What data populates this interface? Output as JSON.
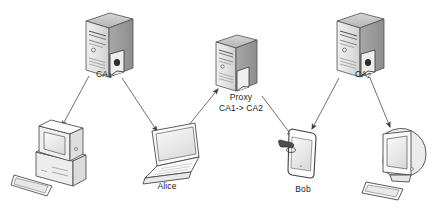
{
  "diagram": {
    "background_color": "#ffffff",
    "stroke_color": "#4a4a4a",
    "text_color": "#1b1b1b",
    "device_fill_light": "#f2f2f2",
    "device_fill_mid": "#d8d8d8",
    "device_fill_dark": "#9e9e9e"
  },
  "nodes": [
    {
      "id": "ca1",
      "type": "server-tower",
      "icon": "server-tower-with-certificate-icon",
      "label": "CA",
      "label_sub": "1",
      "label_x": 104,
      "label_y": 70
    },
    {
      "id": "proxy",
      "type": "server-tower",
      "icon": "server-tower-proxy-icon",
      "label_line1": "Proxy",
      "label_line2_pre": "CA",
      "label_line2_sub1": "1",
      "label_line2_arrow": "-> ",
      "label_line2_post": "CA",
      "label_line2_sub2": "2",
      "label_line2_full": "CA1-> CA2",
      "label_x": 241,
      "label_y": 93
    },
    {
      "id": "ca2",
      "type": "server-tower",
      "icon": "server-tower-with-certificate-icon",
      "label": "CA",
      "label_sub": "2",
      "label_x": 363,
      "label_y": 70
    },
    {
      "id": "desktop-pc",
      "type": "desktop-computer",
      "icon": "desktop-computer-crt-icon",
      "label": "",
      "label_x": 57,
      "label_y": 196
    },
    {
      "id": "alice",
      "type": "laptop",
      "icon": "laptop-icon",
      "label": "Alice",
      "label_x": 167,
      "label_y": 182
    },
    {
      "id": "bob",
      "type": "tablet",
      "icon": "tablet-device-icon",
      "label": "Bob",
      "label_x": 303,
      "label_y": 185
    },
    {
      "id": "imac",
      "type": "monitor",
      "icon": "all-in-one-monitor-icon",
      "label": "",
      "label_x": 403,
      "label_y": 196
    }
  ],
  "edges": [
    {
      "id": "ca1-to-desktop",
      "from": "ca1",
      "to": "desktop-pc",
      "arrow": "end"
    },
    {
      "id": "ca1-to-alice",
      "from": "ca1",
      "to": "alice",
      "arrow": "end"
    },
    {
      "id": "alice-to-proxy",
      "from": "alice",
      "to": "proxy",
      "arrow": "end"
    },
    {
      "id": "proxy-to-bob",
      "from": "proxy",
      "to": "bob",
      "arrow": "end"
    },
    {
      "id": "ca2-to-bob",
      "from": "ca2",
      "to": "bob",
      "arrow": "end"
    },
    {
      "id": "ca2-to-imac",
      "from": "ca2",
      "to": "imac",
      "arrow": "end"
    }
  ]
}
